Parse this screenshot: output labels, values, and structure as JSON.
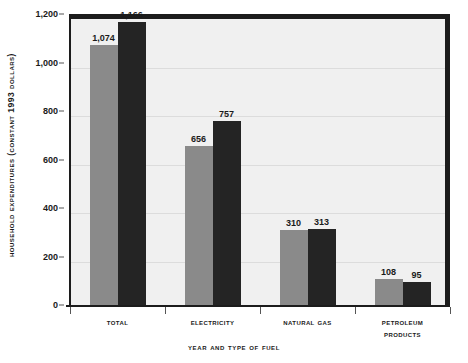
{
  "chart_data": {
    "type": "bar",
    "title": "",
    "xlabel": "Year and Type of Fuel",
    "ylabel": "Household Expenditures (Constant 1993 Dollars)",
    "categories": [
      "Total",
      "Electricity",
      "Natural Gas",
      "Petroleum Products"
    ],
    "series": [
      {
        "name": "series-1",
        "values": [
          1074,
          656,
          310,
          108
        ]
      },
      {
        "name": "series-2",
        "values": [
          1166,
          757,
          313,
          95
        ]
      }
    ],
    "value_labels": [
      [
        "1,074",
        "1,166"
      ],
      [
        "656",
        "757"
      ],
      [
        "310",
        "313"
      ],
      [
        "108",
        "95"
      ]
    ],
    "ylim": [
      0,
      1200
    ],
    "yticks": [
      0,
      200,
      400,
      600,
      800,
      1000,
      1200
    ],
    "ytick_labels": [
      "0",
      "200",
      "400",
      "600",
      "800",
      "1,000",
      "1,200"
    ],
    "grid": true,
    "legend": "none",
    "colors": {
      "series_1": "#8a8a8a",
      "series_2": "#242424",
      "plot_background": "#f0f0f0",
      "gridline": "#dcdcdc",
      "axis": "#1c1c1c",
      "text": "#1a1a1a",
      "page_background": "#ffffff"
    }
  }
}
